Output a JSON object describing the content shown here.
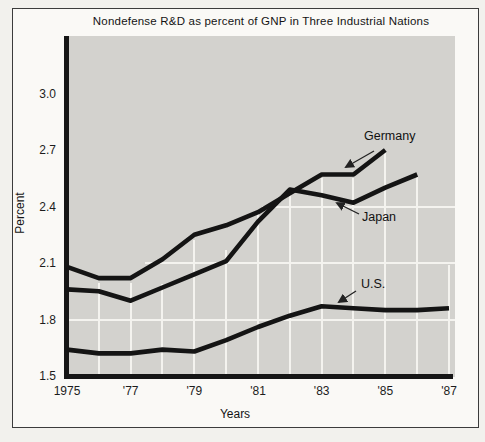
{
  "chart_data": {
    "type": "line",
    "title": "Nondefense R&D as percent of GNP in Three Industrial Nations",
    "xlabel": "Years",
    "ylabel": "Percent",
    "x_ticks": [
      {
        "label": "1975",
        "year": 1975
      },
      {
        "label": "'77",
        "year": 1977
      },
      {
        "label": "'79",
        "year": 1979
      },
      {
        "label": "'81",
        "year": 1981
      },
      {
        "label": "'83",
        "year": 1983
      },
      {
        "label": "'85",
        "year": 1985
      },
      {
        "label": "'87",
        "year": 1987
      }
    ],
    "y_ticks": [
      {
        "label": "3.0",
        "value": 3.0
      },
      {
        "label": "2.7",
        "value": 2.7
      },
      {
        "label": "2.4",
        "value": 2.4
      },
      {
        "label": "2.1",
        "value": 2.1
      },
      {
        "label": "1.8",
        "value": 1.8
      },
      {
        "label": "1.5",
        "value": 1.5
      }
    ],
    "xlim": [
      1975,
      1987
    ],
    "ylim": [
      1.5,
      3.2
    ],
    "grid": "white gridlines on gray panel, vertical line each year",
    "legend_position": "in-chart labels with arrows",
    "series": [
      {
        "name": "Germany",
        "x": [
          1975,
          1976,
          1977,
          1978,
          1979,
          1980,
          1981,
          1982,
          1983,
          1984,
          1985
        ],
        "values": [
          2.08,
          2.02,
          2.02,
          2.12,
          2.25,
          2.3,
          2.37,
          2.47,
          2.57,
          2.57,
          2.7
        ]
      },
      {
        "name": "Japan",
        "x": [
          1975,
          1976,
          1977,
          1978,
          1979,
          1980,
          1981,
          1982,
          1983,
          1984,
          1985,
          1986
        ],
        "values": [
          1.96,
          1.95,
          1.9,
          1.97,
          2.04,
          2.11,
          2.32,
          2.49,
          2.46,
          2.42,
          2.5,
          2.57
        ]
      },
      {
        "name": "U.S.",
        "x": [
          1975,
          1976,
          1977,
          1978,
          1979,
          1980,
          1981,
          1982,
          1983,
          1984,
          1985,
          1986,
          1987
        ],
        "values": [
          1.64,
          1.62,
          1.62,
          1.64,
          1.63,
          1.69,
          1.76,
          1.82,
          1.87,
          1.86,
          1.85,
          1.85,
          1.86
        ]
      }
    ]
  },
  "colors": {
    "plot_background": "#d3d2ce",
    "line": "#141414",
    "gridline": "#f4f3ef",
    "text": "#1c1c1c",
    "page": "#faf9f6"
  }
}
